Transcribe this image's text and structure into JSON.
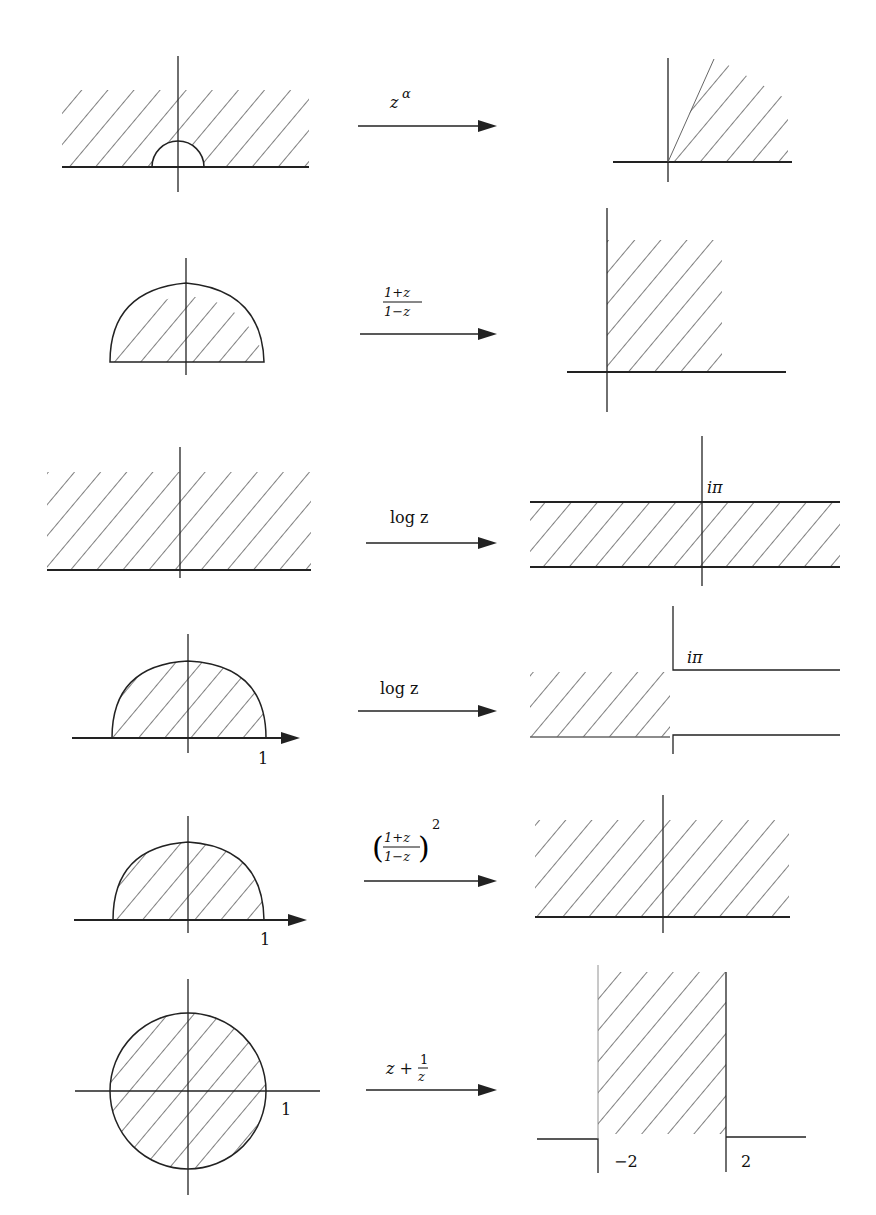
{
  "figure": {
    "rows": [
      {
        "id": "z-alpha",
        "map_label": "z",
        "map_sup": "α",
        "domain": "upper half-plane minus small half-disk",
        "image": "wedge sector"
      },
      {
        "id": "mobius",
        "map_num": "1+z",
        "map_den": "1−z",
        "domain": "upper half of unit disk",
        "image": "first quadrant"
      },
      {
        "id": "log-halfplane",
        "map_label": "log z",
        "domain": "upper half-plane",
        "image": "horizontal strip 0 < Im < π",
        "image_label": "iπ"
      },
      {
        "id": "log-halfdisk",
        "map_label": "log z",
        "domain": "upper half of unit disk",
        "domain_label": "1",
        "image": "half-strip Re < 0, 0 < Im < π",
        "image_label": "iπ"
      },
      {
        "id": "mobius-squared",
        "map_num": "1+z",
        "map_den": "1−z",
        "map_sup": "2",
        "domain": "upper half of unit disk",
        "domain_label": "1",
        "image": "upper half-plane"
      },
      {
        "id": "joukowski",
        "map_label_a": "z +",
        "map_num": "1",
        "map_den": "z",
        "domain": "unit disk",
        "domain_label": "1",
        "image": "plane with slits",
        "image_label_left": "−2",
        "image_label_right": "2"
      }
    ]
  }
}
